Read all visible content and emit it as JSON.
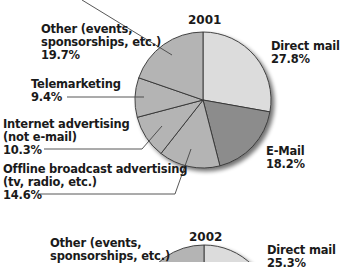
{
  "chart_data": [
    {
      "type": "pie",
      "title": "2001",
      "start_angle": "12 o'clock, clockwise",
      "slices": [
        {
          "label": "Direct mail",
          "value": 27.8,
          "value_text": "27.8%",
          "color": "#dcdcdc"
        },
        {
          "label": "E-Mail",
          "value": 18.2,
          "value_text": "18.2%",
          "color": "#8c8c8c"
        },
        {
          "label": "Offline broadcast advertising (tv, radio, etc.)",
          "value": 14.6,
          "value_text": "14.6%",
          "color": "#b4b4b4"
        },
        {
          "label": "Internet advertising (not e-mail)",
          "value": 10.3,
          "value_text": "10.3%",
          "color": "#b4b4b4"
        },
        {
          "label": "Telemarketing",
          "value": 9.4,
          "value_text": "9.4%",
          "color": "#b4b4b4"
        },
        {
          "label": "Other (events, sponsorships, etc.)",
          "value": 19.7,
          "value_text": "19.7%",
          "color": "#b4b4b4"
        }
      ]
    },
    {
      "type": "pie",
      "title": "2002",
      "partially_visible": true,
      "slices": [
        {
          "label": "Direct mail",
          "value_text": "25.3%",
          "color": "#dcdcdc"
        },
        {
          "label": "Other (events, sponsorships, etc.)",
          "color": "#b4b4b4"
        }
      ]
    }
  ],
  "pie2001": {
    "title": "2001",
    "labels": {
      "other_l1": "Other (events,",
      "other_l2": "sponsorships, etc.)",
      "other_val": "19.7%",
      "tele_l1": "Telemarketing",
      "tele_val": "9.4%",
      "internet_l1": "Internet advertising",
      "internet_l2": "(not e-mail)",
      "internet_val": "10.3%",
      "offline_l1": "Offline broadcast advertising",
      "offline_l2": "(tv, radio, etc.)",
      "offline_val": "14.6%",
      "direct_l1": "Direct mail",
      "direct_val": "27.8%",
      "email_l1": "E-Mail",
      "email_val": "18.2%"
    }
  },
  "pie2002": {
    "title": "2002",
    "labels": {
      "other_l1": "Other (events,",
      "other_l2": "sponsorships, etc.)",
      "direct_l1": "Direct mail",
      "direct_val": "25.3%"
    }
  }
}
